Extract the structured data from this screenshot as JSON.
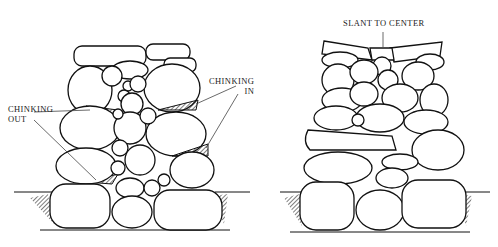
{
  "figure": {
    "left_wall": {
      "labels": {
        "chinking_out": [
          "CHINKING",
          "OUT"
        ],
        "chinking_in": [
          "CHINKING",
          "IN"
        ]
      }
    },
    "right_wall": {
      "labels": {
        "slant_to_center": "SLANT TO CENTER"
      }
    }
  }
}
